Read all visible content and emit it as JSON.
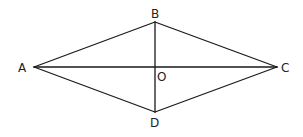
{
  "diagram": {
    "type": "rhombus-with-diagonals",
    "stroke_color": "#1a1a1a",
    "vertices": {
      "A": {
        "x": 34,
        "y": 67
      },
      "B": {
        "x": 155,
        "y": 22
      },
      "C": {
        "x": 277,
        "y": 67
      },
      "D": {
        "x": 155,
        "y": 112
      },
      "O": {
        "x": 155,
        "y": 67
      }
    },
    "labels": {
      "A": "A",
      "B": "B",
      "C": "C",
      "D": "D",
      "O": "O"
    },
    "sides": [
      "AB",
      "BC",
      "CD",
      "DA"
    ],
    "diagonals": [
      "AC",
      "BD"
    ]
  }
}
